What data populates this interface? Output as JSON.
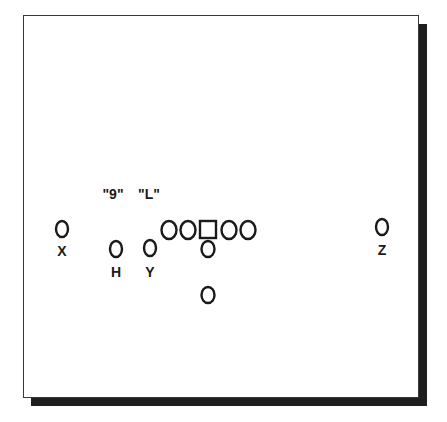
{
  "diagram": {
    "type": "football-formation",
    "calls": [
      {
        "id": "call-9",
        "text": "\"9\"",
        "x": 113,
        "y": 199
      },
      {
        "id": "call-L",
        "text": "\"L\"",
        "x": 149,
        "y": 199
      }
    ],
    "offensive_line": [
      {
        "id": "left-tackle",
        "shape": "circle",
        "x": 169,
        "y": 230
      },
      {
        "id": "left-guard",
        "shape": "circle",
        "x": 188,
        "y": 230
      },
      {
        "id": "center",
        "shape": "square",
        "x": 208,
        "y": 229
      },
      {
        "id": "right-guard",
        "shape": "circle",
        "x": 229,
        "y": 230
      },
      {
        "id": "right-tackle",
        "shape": "circle",
        "x": 248,
        "y": 230
      }
    ],
    "skill_players": [
      {
        "id": "X",
        "label": "X",
        "shape": "circle",
        "x": 62,
        "y": 229,
        "label_y": 256
      },
      {
        "id": "H",
        "label": "H",
        "shape": "circle",
        "x": 116,
        "y": 249,
        "label_y": 277
      },
      {
        "id": "Y",
        "label": "Y",
        "shape": "circle",
        "x": 150,
        "y": 248,
        "label_y": 277
      },
      {
        "id": "Z",
        "label": "Z",
        "shape": "circle",
        "x": 382,
        "y": 227,
        "label_y": 255
      }
    ],
    "backfield": [
      {
        "id": "quarterback",
        "shape": "circle",
        "x": 208,
        "y": 249
      },
      {
        "id": "running-back",
        "shape": "circle",
        "x": 208,
        "y": 295
      }
    ],
    "colors": {
      "ink": "#1a1a1a",
      "shadow": "#1e1e1e",
      "background": "#ffffff"
    }
  }
}
